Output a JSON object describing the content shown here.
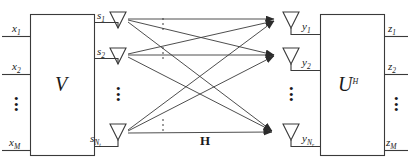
{
  "figure": {
    "stroke_color": "#3a3a3a",
    "text_color": "#1a1a1a",
    "background": "#ffffff"
  },
  "blocks": {
    "precoder": {
      "label": "V",
      "name": "precoder-block"
    },
    "combiner": {
      "label": "U",
      "superscript": "H",
      "name": "combiner-block"
    }
  },
  "channel": {
    "label": "H",
    "name": "channel-matrix-label",
    "arrow_count": 9
  },
  "inputs": [
    {
      "base": "x",
      "subscript": "1"
    },
    {
      "base": "x",
      "subscript": "2"
    },
    {
      "base": "x",
      "subscript": "M"
    }
  ],
  "transmit_streams": [
    {
      "base": "s",
      "subscript": "1"
    },
    {
      "base": "s",
      "subscript": "2"
    },
    {
      "base": "s",
      "subscript": "N",
      "subscript2": "t"
    }
  ],
  "receive_streams": [
    {
      "base": "y",
      "subscript": "1"
    },
    {
      "base": "y",
      "subscript": "2"
    },
    {
      "base": "y",
      "subscript": "N",
      "subscript2": "r"
    }
  ],
  "outputs": [
    {
      "base": "z",
      "subscript": "1"
    },
    {
      "base": "z",
      "subscript": "2"
    },
    {
      "base": "z",
      "subscript": "M"
    }
  ],
  "ellipses": {
    "glyph": "•",
    "count": 3,
    "positions": [
      "inputs",
      "transmit",
      "receive",
      "outputs",
      "channel"
    ]
  }
}
